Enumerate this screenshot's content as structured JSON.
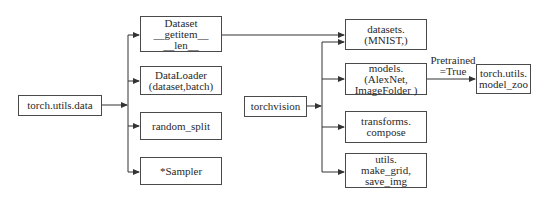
{
  "diagram": {
    "nodes": {
      "torch_utils_data": {
        "lines": [
          "torch.utils.data"
        ]
      },
      "dataset": {
        "lines": [
          "Dataset",
          "__getitem__",
          "__len__"
        ]
      },
      "dataloader": {
        "lines": [
          "DataLoader",
          "(dataset,batch)"
        ]
      },
      "random_split": {
        "lines": [
          "random_split"
        ]
      },
      "sampler": {
        "lines": [
          "*Sampler"
        ]
      },
      "torchvision": {
        "lines": [
          "torchvision"
        ]
      },
      "datasets": {
        "lines": [
          "datasets.",
          "(MNIST,)"
        ]
      },
      "models": {
        "lines": [
          "models.",
          "(AlexNet,",
          "ImageFolder )"
        ]
      },
      "transforms": {
        "lines": [
          "transforms.",
          "compose"
        ]
      },
      "utils": {
        "lines": [
          "utils.",
          "make_grid,",
          "save_img"
        ]
      },
      "model_zoo": {
        "lines": [
          "torch.utils.",
          "model_zoo"
        ]
      }
    },
    "edge_labels": {
      "pretrained": [
        "Pretrained",
        "=True"
      ]
    },
    "edges": [
      {
        "from": "torch_utils_data",
        "to": "dataset"
      },
      {
        "from": "torch_utils_data",
        "to": "dataloader"
      },
      {
        "from": "torch_utils_data",
        "to": "random_split"
      },
      {
        "from": "torch_utils_data",
        "to": "sampler"
      },
      {
        "from": "dataset",
        "to": "datasets"
      },
      {
        "from": "torchvision",
        "to": "datasets"
      },
      {
        "from": "torchvision",
        "to": "models"
      },
      {
        "from": "torchvision",
        "to": "transforms"
      },
      {
        "from": "torchvision",
        "to": "utils"
      },
      {
        "from": "models",
        "to": "model_zoo",
        "label": "pretrained"
      }
    ],
    "line_color": "#333333"
  }
}
